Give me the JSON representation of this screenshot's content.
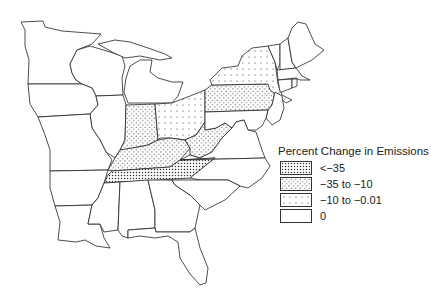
{
  "legend": {
    "title": "Percent Change in Emissions",
    "items": [
      {
        "label": "<−35",
        "pattern": "dense-dots"
      },
      {
        "label": "−35 to −10",
        "pattern": "medium-dots"
      },
      {
        "label": "−10 to −0.01",
        "pattern": "sparse-dots"
      },
      {
        "label": "0",
        "pattern": "none"
      }
    ]
  },
  "map": {
    "region": "Eastern United States",
    "states": {
      "TN": "<−35",
      "KY": "−35 to −10",
      "IN": "−35 to −10",
      "WV": "−35 to −10",
      "PA": "−35 to −10",
      "OH": "−10 to −0.01",
      "NY": "−10 to −0.01",
      "MN": "0",
      "WI": "0",
      "MI": "0",
      "IA": "0",
      "IL": "0",
      "MO": "0",
      "AR": "0",
      "LA": "0",
      "MS": "0",
      "AL": "0",
      "GA": "0",
      "FL": "0",
      "SC": "0",
      "NC": "0",
      "VA": "0",
      "MD": "0",
      "DE": "0",
      "NJ": "0",
      "CT": "0",
      "RI": "0",
      "MA": "0",
      "VT": "0",
      "NH": "0",
      "ME": "0"
    }
  }
}
